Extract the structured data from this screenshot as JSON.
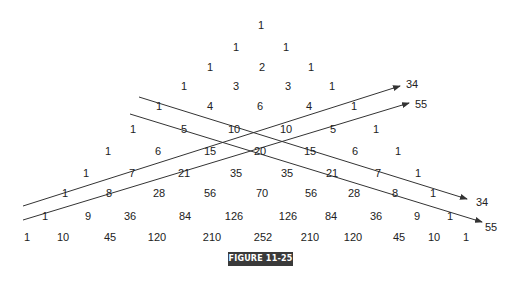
{
  "figure_label": "FIGURE 11-25",
  "rows": [
    {
      "y": 25,
      "cells": [
        {
          "v": "1",
          "x": 261
        }
      ]
    },
    {
      "y": 47,
      "cells": [
        {
          "v": "1",
          "x": 236
        },
        {
          "v": "1",
          "x": 286
        }
      ]
    },
    {
      "y": 67,
      "cells": [
        {
          "v": "1",
          "x": 210
        },
        {
          "v": "2",
          "x": 262
        },
        {
          "v": "1",
          "x": 311
        }
      ]
    },
    {
      "y": 86,
      "cells": [
        {
          "v": "1",
          "x": 184
        },
        {
          "v": "3",
          "x": 236
        },
        {
          "v": "3",
          "x": 288
        },
        {
          "v": "1",
          "x": 332
        }
      ]
    },
    {
      "y": 106,
      "cells": [
        {
          "v": "1",
          "x": 159
        },
        {
          "v": "4",
          "x": 210
        },
        {
          "v": "6",
          "x": 260
        },
        {
          "v": "4",
          "x": 309
        },
        {
          "v": "1",
          "x": 354
        }
      ]
    },
    {
      "y": 129,
      "cells": [
        {
          "v": "1",
          "x": 133
        },
        {
          "v": "5",
          "x": 184
        },
        {
          "v": "10",
          "x": 234
        },
        {
          "v": "10",
          "x": 286
        },
        {
          "v": "5",
          "x": 333
        },
        {
          "v": "1",
          "x": 376
        }
      ]
    },
    {
      "y": 151,
      "cells": [
        {
          "v": "1",
          "x": 108
        },
        {
          "v": "6",
          "x": 158
        },
        {
          "v": "15",
          "x": 210
        },
        {
          "v": "20",
          "x": 260
        },
        {
          "v": "15",
          "x": 310
        },
        {
          "v": "6",
          "x": 355
        },
        {
          "v": "1",
          "x": 398
        }
      ]
    },
    {
      "y": 173,
      "cells": [
        {
          "v": "1",
          "x": 86
        },
        {
          "v": "7",
          "x": 132
        },
        {
          "v": "21",
          "x": 184
        },
        {
          "v": "35",
          "x": 236
        },
        {
          "v": "35",
          "x": 287
        },
        {
          "v": "21",
          "x": 332
        },
        {
          "v": "7",
          "x": 378
        },
        {
          "v": "1",
          "x": 418
        }
      ]
    },
    {
      "y": 193,
      "cells": [
        {
          "v": "1",
          "x": 65
        },
        {
          "v": "8",
          "x": 109
        },
        {
          "v": "28",
          "x": 159
        },
        {
          "v": "56",
          "x": 210
        },
        {
          "v": "70",
          "x": 262
        },
        {
          "v": "56",
          "x": 311
        },
        {
          "v": "28",
          "x": 354
        },
        {
          "v": "8",
          "x": 395
        },
        {
          "v": "1",
          "x": 433
        }
      ]
    },
    {
      "y": 216,
      "cells": [
        {
          "v": "1",
          "x": 45
        },
        {
          "v": "9",
          "x": 88
        },
        {
          "v": "36",
          "x": 130
        },
        {
          "v": "84",
          "x": 185
        },
        {
          "v": "126",
          "x": 234
        },
        {
          "v": "126",
          "x": 288
        },
        {
          "v": "84",
          "x": 331
        },
        {
          "v": "36",
          "x": 376
        },
        {
          "v": "9",
          "x": 417
        },
        {
          "v": "1",
          "x": 450
        }
      ]
    },
    {
      "y": 237,
      "cells": [
        {
          "v": "1",
          "x": 27
        },
        {
          "v": "10",
          "x": 63
        },
        {
          "v": "45",
          "x": 110
        },
        {
          "v": "120",
          "x": 157
        },
        {
          "v": "210",
          "x": 212
        },
        {
          "v": "252",
          "x": 263
        },
        {
          "v": "210",
          "x": 310
        },
        {
          "v": "120",
          "x": 353
        },
        {
          "v": "45",
          "x": 399
        },
        {
          "v": "10",
          "x": 434
        },
        {
          "v": "1",
          "x": 466
        }
      ]
    }
  ],
  "arrows": [
    {
      "name": "diagonal-down-34",
      "x1": 139,
      "y1": 97,
      "x2": 467,
      "y2": 199,
      "label": "34",
      "lx": 476,
      "ly": 202
    },
    {
      "name": "diagonal-down-55",
      "x1": 130,
      "y1": 114,
      "x2": 482,
      "y2": 222,
      "label": "55",
      "lx": 485,
      "ly": 227
    },
    {
      "name": "diagonal-up-34",
      "x1": 23,
      "y1": 206,
      "x2": 400,
      "y2": 86,
      "label": "34",
      "lx": 406,
      "ly": 84
    },
    {
      "name": "diagonal-up-55",
      "x1": 23,
      "y1": 220,
      "x2": 409,
      "y2": 103,
      "label": "55",
      "lx": 415,
      "ly": 104
    }
  ],
  "colors": {
    "text": "#222222",
    "line": "#333333",
    "label_bg": "#3a3a3a",
    "label_fg": "#ffffff"
  }
}
